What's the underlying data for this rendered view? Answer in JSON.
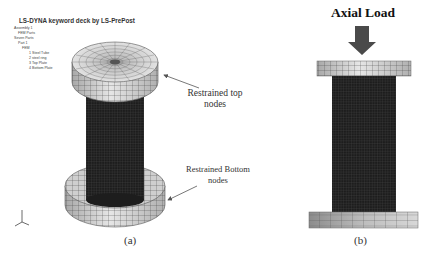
{
  "panel_a": {
    "tree": {
      "title": "LS-DYNA keyword deck by LS-PrePost",
      "items": [
        {
          "label": "Assembly 1",
          "indent": 1
        },
        {
          "label": "FEM Parts",
          "indent": 2
        },
        {
          "label": "Seven Parts",
          "indent": 1
        },
        {
          "label": "Part 1",
          "indent": 2
        },
        {
          "label": "FEM",
          "indent": 3
        },
        {
          "label": "1 Steel Tube",
          "indent": 4
        },
        {
          "label": "2 steel ring",
          "indent": 4
        },
        {
          "label": "3 Top Plate",
          "indent": 4
        },
        {
          "label": "4 Bottom Plate",
          "indent": 4
        }
      ]
    },
    "annotations": {
      "top_line1": "Restrained top",
      "top_line2": "nodes",
      "bottom_line1": "Restrained Bottom",
      "bottom_line2": "nodes"
    },
    "caption": "(a)"
  },
  "panel_b": {
    "load_label": "Axial Load",
    "caption": "(b)"
  },
  "colors": {
    "mesh_dark": "#1e1e1e",
    "plate_light": "#d9d9d9",
    "plate_mid": "#9a9a9a",
    "arrow": "#555555",
    "grid_line": "#3a3a3a"
  }
}
